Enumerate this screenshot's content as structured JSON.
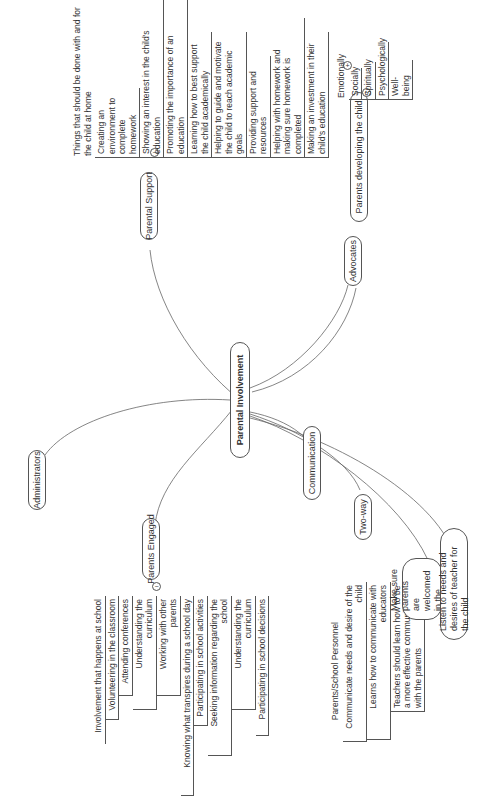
{
  "diagram": {
    "type": "mind-map",
    "orientation": "rotated-90-ccw",
    "central_topic": "Parental Involvement",
    "branches": {
      "parental_support": {
        "label": "Parental Support",
        "header": "Things that should be done with and for the child at home",
        "items": [
          "Creating an environment to complete homework",
          "Showing an interest in the child's education",
          "Promoting the importance of an education",
          "Learning how to best support the child academically",
          "Helping to guide and motivate the child to reach academic goals",
          "Providing support and resources",
          "Helping with homework and making sure homework is completed",
          "Making an investment in their child's education"
        ]
      },
      "advocates": {
        "label": "Advocates",
        "child": {
          "label": "Parents developing the child",
          "header": "Emotionally",
          "items": [
            "Socially",
            "Spiritually",
            "Psychologically",
            "Well-being"
          ]
        }
      },
      "administrators": {
        "label": "Administrators"
      },
      "parents_engaged": {
        "label": "Parents Engaged",
        "items": [
          "Involvement that happens at school",
          "Volunteering in the classroom",
          "Attending conferences",
          "Understanding the curriculum",
          "Working with other parents",
          "Knowing what transpires during a school day",
          "Participating in school activities",
          "Seeking information regarding the school",
          "Understanding the curriculum",
          "Participating in school decisions"
        ]
      },
      "communication": {
        "label": "Communication"
      },
      "two_way": {
        "label": "Two-way",
        "header": "Parents/School Personnel",
        "items": [
          "Communicate needs and desire of the child",
          "Learns how to communicate with educators",
          "Teachers should learn how to be a more effective communicator with the parents"
        ]
      },
      "welcomed": {
        "label": "Make sure parents are welcomed in the school"
      },
      "listen": {
        "label": "Listen to needs and desires of teacher for the child"
      }
    },
    "toggle_expanded": "−",
    "toggle_collapsed": "+"
  }
}
